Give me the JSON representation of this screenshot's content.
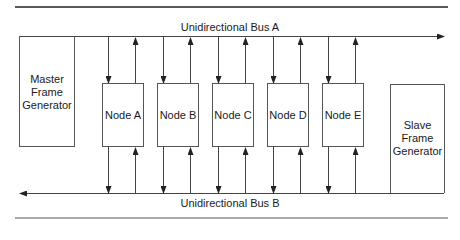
{
  "diagram": {
    "bus_a": {
      "label": "Unidirectional Bus A",
      "direction": "right"
    },
    "bus_b": {
      "label": "Unidirectional Bus B",
      "direction": "left"
    },
    "master": {
      "label": "Master\nFrame\nGenerator"
    },
    "slave": {
      "label": "Slave\nFrame\nGenerator"
    },
    "nodes": [
      {
        "label": "Node A"
      },
      {
        "label": "Node B"
      },
      {
        "label": "Node C"
      },
      {
        "label": "Node D"
      },
      {
        "label": "Node E"
      }
    ],
    "colors": {
      "line": "#333333",
      "box_border": "#555555",
      "rule": "#222222"
    }
  }
}
